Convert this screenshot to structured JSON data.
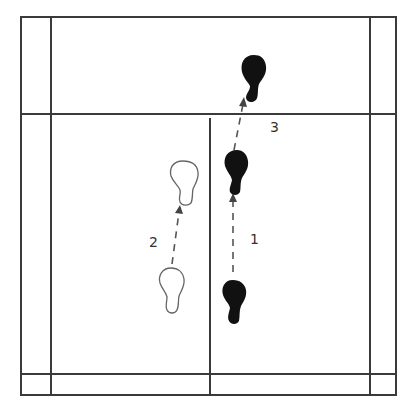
{
  "diagram": {
    "type": "badminton-footwork",
    "court": {
      "outer_left_x": 21,
      "inner_left_x": 51,
      "center_x": 210,
      "inner_right_x": 370,
      "outer_right_x": 396,
      "top_y": 17,
      "service_line_y": 114,
      "inner_bottom_y": 374,
      "outer_bottom_y": 395
    },
    "steps": [
      {
        "label": "1",
        "from": "bottom-right-foot",
        "to": "middle-right-foot",
        "style": "solid-foot"
      },
      {
        "label": "2",
        "from": "bottom-left-foot",
        "to": "middle-left-foot",
        "style": "outline-foot"
      },
      {
        "label": "3",
        "from": "middle-right-foot",
        "to": "top-right-foot",
        "style": "solid-foot"
      }
    ],
    "labels": {
      "step1": "1",
      "step2": "2",
      "step3": "3"
    },
    "colors": {
      "lines": "#3a3a3a",
      "solid_foot": "#111111",
      "outline_foot": "#666666"
    }
  }
}
